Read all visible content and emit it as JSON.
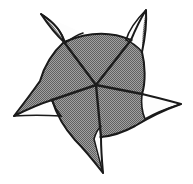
{
  "figure": {
    "title": "Five-armed curved pinwheel polygon",
    "type": "geometric-diagram",
    "symmetry_order": 5,
    "canvas": {
      "width": 193,
      "height": 184,
      "background": "#ffffff"
    },
    "colors": {
      "fill_gray": "#868686",
      "outline_black": "#1a1a1a",
      "notch_white": "#fdfdfd",
      "spoke_black": "#1d1d1d",
      "background": "#ffffff"
    },
    "center_point": {
      "x": 96,
      "y": 85
    },
    "spike_tips": [
      {
        "name": "spike-top-right",
        "x": 146,
        "y": 10
      },
      {
        "name": "spike-right",
        "x": 181,
        "y": 104
      },
      {
        "name": "spike-bottom",
        "x": 103,
        "y": 173
      },
      {
        "name": "spike-left",
        "x": 14,
        "y": 116
      },
      {
        "name": "spike-top-left",
        "x": 41,
        "y": 14
      }
    ],
    "spoke_endpoints": [
      {
        "name": "spoke-to-top-right",
        "x": 131,
        "y": 40
      },
      {
        "name": "spoke-to-right",
        "x": 142,
        "y": 94
      },
      {
        "name": "spoke-to-bottom",
        "x": 101,
        "y": 137
      },
      {
        "name": "spoke-to-bottom-left",
        "x": 52,
        "y": 100
      },
      {
        "name": "spoke-to-top-left",
        "x": 64,
        "y": 42
      }
    ],
    "notches": [
      {
        "name": "notch-top-right",
        "shape": "crescent"
      },
      {
        "name": "notch-right",
        "shape": "crescent"
      },
      {
        "name": "notch-bottom",
        "shape": "crescent"
      },
      {
        "name": "notch-left",
        "shape": "crescent"
      },
      {
        "name": "notch-top-left",
        "shape": "crescent"
      }
    ],
    "spoke_count": 5,
    "arm_count": 5,
    "fill_texture": "halftone-dither"
  }
}
